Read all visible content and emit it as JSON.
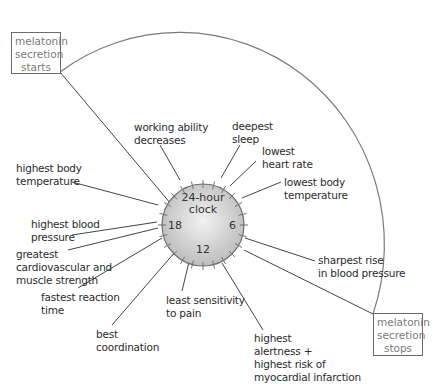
{
  "diagram": {
    "clock": {
      "title": "24-hour\nclock",
      "hour_18": "18",
      "hour_6": "6",
      "hour_12": "12"
    },
    "melatonin": {
      "start": "melatonin\nsecretion\nstarts",
      "stop": "melatonin\nsecretion\nstops"
    },
    "labels": {
      "working_ability": "working ability\ndecreases",
      "deepest_sleep": "deepest\nsleep",
      "lowest_heart_rate": "lowest\nheart rate",
      "lowest_body_temp": "lowest body\ntemperature",
      "highest_body_temp": "highest body\ntemperature",
      "highest_blood_pressure": "highest blood\npressure",
      "greatest_strength": "greatest\ncardiovascular and\nmuscle strength",
      "fastest_reaction": "fastest reaction\ntime",
      "best_coordination": "best\ncoordination",
      "least_pain": "least sensitivity\nto pain",
      "highest_alertness": "highest\nalertness +\nhighest risk of\nmyocardial infarction",
      "sharpest_rise_bp": "sharpest rise\nin blood pressure"
    }
  }
}
